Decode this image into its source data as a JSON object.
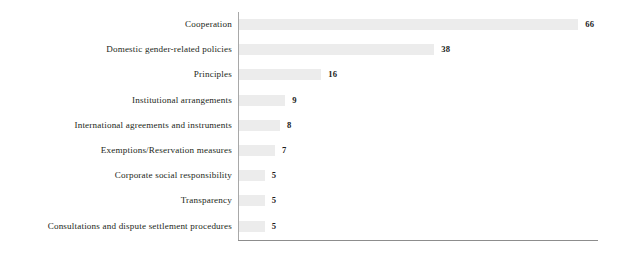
{
  "chart_data": {
    "type": "bar",
    "orientation": "horizontal",
    "title": "",
    "subtitle": "",
    "xlabel": "",
    "ylabel": "",
    "xlim": [
      0,
      66
    ],
    "grid": false,
    "legend": null,
    "value_labels_shown": true,
    "categories": [
      "Cooperation",
      "Domestic gender-related policies",
      "Principles",
      "Institutional arrangements",
      "International agreements and instruments",
      "Exemptions/Reservation measures",
      "Corporate social responsibility",
      "Transparency",
      "Consultations and dispute settlement procedures"
    ],
    "values": [
      66,
      38,
      16,
      9,
      8,
      7,
      5,
      5,
      5
    ],
    "value_label_texts": [
      "66",
      "38",
      "16",
      "9",
      "8",
      "7",
      "5",
      "5",
      "5"
    ],
    "colors": {
      "bar_fill": "#ececec",
      "value_label": "#1c1c1c",
      "category_label": "#231f20",
      "y_axis": "#a8a8a8",
      "x_axis": "#8d8d8d",
      "background": "#ffffff"
    }
  }
}
